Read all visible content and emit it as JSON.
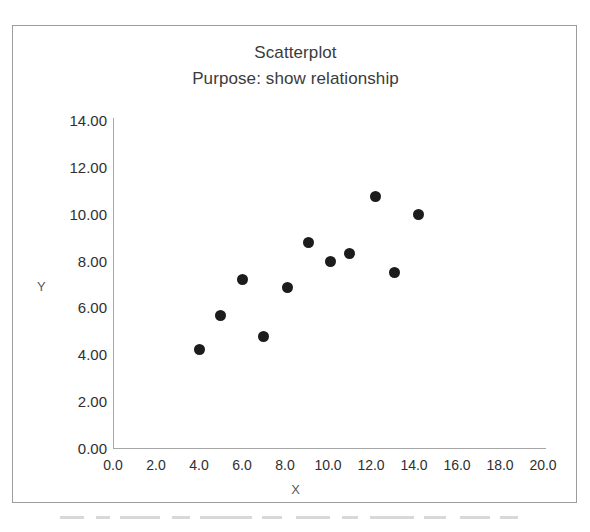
{
  "chart_data": {
    "type": "scatter",
    "title": "Scatterplot",
    "subtitle": "Purpose: show relationship",
    "xlabel": "X",
    "ylabel": "Y",
    "xlim": [
      0.0,
      20.0
    ],
    "ylim": [
      0.0,
      14.0
    ],
    "xticks": [
      "0.0",
      "2.0",
      "4.0",
      "6.0",
      "8.0",
      "10.0",
      "12.0",
      "14.0",
      "16.0",
      "18.0",
      "20.0"
    ],
    "xtick_values": [
      0,
      2,
      4,
      6,
      8,
      10,
      12,
      14,
      16,
      18,
      20
    ],
    "yticks": [
      "0.00",
      "2.00",
      "4.00",
      "6.00",
      "8.00",
      "10.00",
      "12.00",
      "14.00"
    ],
    "ytick_values": [
      0,
      2,
      4,
      6,
      8,
      10,
      12,
      14
    ],
    "grid": false,
    "legend": false,
    "marker_color": "#1c1c1c",
    "marker_shape": "circle",
    "points": [
      {
        "x": 4.0,
        "y": 4.2
      },
      {
        "x": 5.0,
        "y": 5.65
      },
      {
        "x": 6.0,
        "y": 7.2
      },
      {
        "x": 7.0,
        "y": 4.75
      },
      {
        "x": 8.1,
        "y": 6.85
      },
      {
        "x": 9.1,
        "y": 8.75
      },
      {
        "x": 10.1,
        "y": 7.95
      },
      {
        "x": 11.0,
        "y": 8.3
      },
      {
        "x": 12.2,
        "y": 10.75
      },
      {
        "x": 13.1,
        "y": 7.5
      },
      {
        "x": 14.2,
        "y": 9.95
      }
    ]
  },
  "chart": {
    "title": "Scatterplot",
    "subtitle": "Purpose: show relationship",
    "x_axis_title": "X",
    "y_axis_title": "Y"
  }
}
